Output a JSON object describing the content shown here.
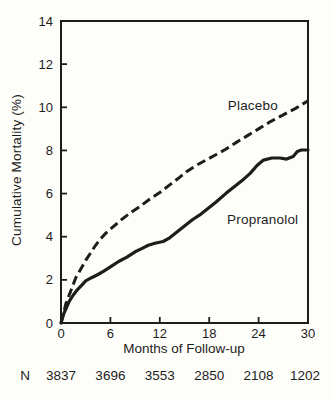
{
  "figure": {
    "background": "#fdfdfa",
    "ink": "#1d1d1d"
  },
  "chart_data": {
    "type": "line",
    "title": "",
    "xlabel": "Months of Follow-up",
    "ylabel": "Cumulative Mortality (%)",
    "xlim": [
      0,
      30
    ],
    "ylim": [
      0,
      14
    ],
    "xticks": [
      0,
      6,
      12,
      18,
      24,
      30
    ],
    "yticks": [
      0,
      2,
      4,
      6,
      8,
      10,
      12,
      14
    ],
    "grid": false,
    "legend_position": "inline-labels",
    "series": [
      {
        "name": "Placebo",
        "style": "dashed",
        "label": {
          "text": "Placebo",
          "x": 23.3,
          "y": 10.1
        },
        "points": [
          [
            0,
            0
          ],
          [
            0.3,
            0.45
          ],
          [
            0.6,
            0.9
          ],
          [
            1,
            1.3
          ],
          [
            1.4,
            1.7
          ],
          [
            1.8,
            2.1
          ],
          [
            2.4,
            2.5
          ],
          [
            3,
            2.9
          ],
          [
            3.6,
            3.25
          ],
          [
            4.2,
            3.6
          ],
          [
            4.8,
            3.9
          ],
          [
            5.4,
            4.15
          ],
          [
            6,
            4.35
          ],
          [
            7.2,
            4.75
          ],
          [
            8.4,
            5.1
          ],
          [
            9.6,
            5.4
          ],
          [
            10.8,
            5.75
          ],
          [
            12,
            6.05
          ],
          [
            13.2,
            6.4
          ],
          [
            14.4,
            6.75
          ],
          [
            15.2,
            7.0
          ],
          [
            16.4,
            7.3
          ],
          [
            17.6,
            7.55
          ],
          [
            18.8,
            7.8
          ],
          [
            20,
            8.05
          ],
          [
            21.2,
            8.35
          ],
          [
            22.5,
            8.65
          ],
          [
            24,
            9.0
          ],
          [
            25.5,
            9.35
          ],
          [
            27,
            9.65
          ],
          [
            28.5,
            9.95
          ],
          [
            30,
            10.3
          ]
        ]
      },
      {
        "name": "Propranolol",
        "style": "solid",
        "label": {
          "text": "Propranolol",
          "x": 24.5,
          "y": 4.82
        },
        "points": [
          [
            0,
            0
          ],
          [
            0.3,
            0.4
          ],
          [
            0.7,
            0.75
          ],
          [
            1,
            1.0
          ],
          [
            1.5,
            1.3
          ],
          [
            2,
            1.55
          ],
          [
            2.5,
            1.75
          ],
          [
            3,
            1.95
          ],
          [
            3.7,
            2.1
          ],
          [
            4.5,
            2.25
          ],
          [
            5.2,
            2.4
          ],
          [
            6,
            2.6
          ],
          [
            7,
            2.85
          ],
          [
            8,
            3.05
          ],
          [
            9,
            3.3
          ],
          [
            9.8,
            3.45
          ],
          [
            10.6,
            3.6
          ],
          [
            11.4,
            3.7
          ],
          [
            12.4,
            3.78
          ],
          [
            13.2,
            3.95
          ],
          [
            14,
            4.2
          ],
          [
            15,
            4.5
          ],
          [
            16,
            4.8
          ],
          [
            17,
            5.05
          ],
          [
            18,
            5.35
          ],
          [
            18.8,
            5.6
          ],
          [
            20,
            6.0
          ],
          [
            21,
            6.3
          ],
          [
            22,
            6.6
          ],
          [
            23,
            6.95
          ],
          [
            23.8,
            7.3
          ],
          [
            24.6,
            7.55
          ],
          [
            25.6,
            7.65
          ],
          [
            26.6,
            7.65
          ],
          [
            27.4,
            7.6
          ],
          [
            28.2,
            7.72
          ],
          [
            28.7,
            7.95
          ],
          [
            29.2,
            8.02
          ],
          [
            30,
            8.02
          ]
        ]
      }
    ],
    "n_row": {
      "label": "N",
      "months": [
        0,
        6,
        12,
        18,
        24,
        30
      ],
      "values": [
        "3837",
        "3696",
        "3553",
        "2850",
        "2108",
        "1202"
      ]
    }
  }
}
